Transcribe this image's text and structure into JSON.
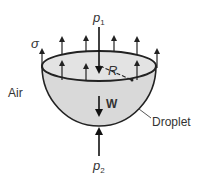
{
  "diagram": {
    "labels": {
      "p1": "p",
      "p1_sub": "1",
      "p2": "p",
      "p2_sub": "2",
      "sigma": "σ",
      "radius": "R",
      "weight": "W",
      "air": "Air",
      "droplet": "Droplet"
    },
    "colors": {
      "fill": "#d9d9d9",
      "stroke": "#222222",
      "text": "#333333"
    }
  }
}
